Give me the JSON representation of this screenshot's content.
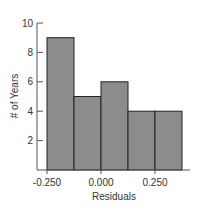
{
  "chart_data": {
    "type": "bar",
    "title": "",
    "xlabel": "Residuals",
    "ylabel": "# of Years",
    "bins": [
      {
        "start": -0.25,
        "end": -0.125,
        "value": 9
      },
      {
        "start": -0.125,
        "end": 0.0,
        "value": 5
      },
      {
        "start": 0.0,
        "end": 0.125,
        "value": 6
      },
      {
        "start": 0.125,
        "end": 0.25,
        "value": 4
      },
      {
        "start": 0.25,
        "end": 0.375,
        "value": 4
      }
    ],
    "xlim": [
      -0.25,
      0.375
    ],
    "ylim": [
      0,
      10
    ],
    "xticks": [
      {
        "value": -0.25,
        "label": "-0.250"
      },
      {
        "value": 0.0,
        "label": "0.000"
      },
      {
        "value": 0.25,
        "label": "0.250"
      }
    ],
    "yticks": [
      {
        "value": 2,
        "label": "2"
      },
      {
        "value": 4,
        "label": "4"
      },
      {
        "value": 6,
        "label": "6"
      },
      {
        "value": 8,
        "label": "8"
      },
      {
        "value": 10,
        "label": "10"
      }
    ],
    "grid": false,
    "bar_color": "#8c8c8c",
    "edge_color": "#222222"
  }
}
